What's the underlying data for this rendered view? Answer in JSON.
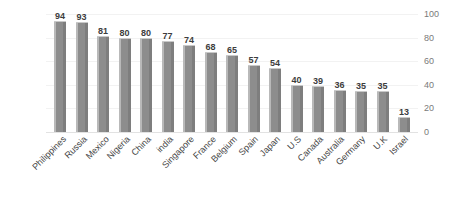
{
  "chart_data": {
    "type": "bar",
    "title": "",
    "subtitle": "",
    "xlabel": "",
    "ylabel": "",
    "ylim": [
      0,
      100
    ],
    "yticks": [
      100,
      80,
      60,
      40,
      20,
      0
    ],
    "grid": true,
    "legend": false,
    "legend_position": "none",
    "axis_position": "right",
    "label_rotation": -45,
    "bar_color": "#8d8d8d",
    "bar_highlight_color": "#b9b9b9",
    "text_color": "#3d3d3d",
    "tick_color": "#7a7a7a",
    "gridline_color": "#f2f2f2",
    "background_color": "#ffffff",
    "categories": [
      "Philippines",
      "Russia",
      "Mexico",
      "Nigeria",
      "China",
      "india",
      "Singapore",
      "France",
      "Belgium",
      "Spain",
      "Japan",
      "U.S",
      "Canada",
      "Australia",
      "Germany",
      "U.K",
      "Israel"
    ],
    "values": [
      94,
      93,
      81,
      80,
      80,
      77,
      74,
      68,
      65,
      57,
      54,
      40,
      39,
      36,
      35,
      35,
      13
    ],
    "data_labels": [
      "94",
      "93",
      "81",
      "80",
      "80",
      "77",
      "74",
      "68",
      "65",
      "57",
      "54",
      "40",
      "39",
      "36",
      "35",
      "35",
      "13"
    ]
  }
}
